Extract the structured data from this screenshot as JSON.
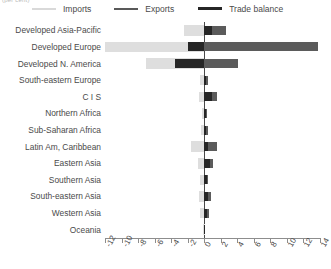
{
  "top_caption": "(per cent)",
  "legend": {
    "items": [
      {
        "key": "imports",
        "label": "Imports",
        "color": "#d9d9d9"
      },
      {
        "key": "exports",
        "label": "Exports",
        "color": "#595959"
      },
      {
        "key": "balance",
        "label": "Trade balance",
        "color": "#262626"
      }
    ]
  },
  "chart_data": {
    "type": "bar",
    "orientation": "horizontal",
    "title": "",
    "subtitle": "",
    "xlabel": "",
    "ylabel": "",
    "xlim": [
      -12,
      14
    ],
    "xticks": [
      -12,
      -10,
      -8,
      -6,
      -4,
      -2,
      0,
      2,
      4,
      6,
      8,
      10,
      12,
      14
    ],
    "xticklabels": [
      "-12",
      "-10",
      "-8",
      "-6",
      "-4",
      "-2",
      "0",
      "2",
      "4",
      "6",
      "8",
      "10",
      "12",
      "14"
    ],
    "grid": false,
    "legend_position": "top",
    "zero_line": 0,
    "categories": [
      "Developed Asia-Pacific",
      "Developed Europe",
      "Developed N. America",
      "South-eastern Europe",
      "C I S",
      "Northern Africa",
      "Sub-Saharan Africa",
      "Latin Am, Caribbean",
      "Eastern Asia",
      "Southern Asia",
      "South-eastern Asia",
      "Western Asia",
      "Oceania"
    ],
    "series": [
      {
        "name": "Imports",
        "color": "#d9d9d9",
        "values": [
          -2.4,
          -12.0,
          -7.0,
          -0.5,
          -0.6,
          -0.3,
          -0.4,
          -1.6,
          -0.8,
          -0.5,
          -0.6,
          -0.5,
          -0.1
        ]
      },
      {
        "name": "Exports",
        "color": "#595959",
        "values": [
          2.6,
          13.8,
          4.1,
          0.4,
          1.6,
          0.3,
          0.4,
          1.6,
          1.1,
          0.5,
          0.8,
          0.6,
          0.1
        ]
      },
      {
        "name": "Trade balance",
        "color": "#262626",
        "values": [
          0.9,
          -2.0,
          -3.5,
          0.2,
          1.0,
          0.2,
          0.2,
          0.5,
          0.7,
          0.3,
          0.5,
          0.3,
          0.05
        ]
      }
    ]
  }
}
